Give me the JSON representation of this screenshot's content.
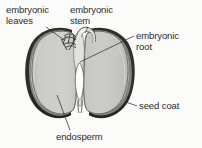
{
  "figure": {
    "labels": {
      "embryonic_leaves": "embryonic\nleaves",
      "embryonic_leaves_line1": "embryonic",
      "embryonic_leaves_line2": "leaves",
      "embryonic_stem_line1": "embryonic",
      "embryonic_stem_line2": "stem",
      "embryonic_root_line1": "embryonic",
      "embryonic_root_line2": "root",
      "seed_coat": "seed  coat",
      "endosperm": "endosperm"
    },
    "colors": {
      "ink": "#2b2b2b",
      "seed_coat_dark": "#2e2c2a",
      "seed_coat_mid": "#4a4744",
      "endosperm_fill": "#c9c9c6",
      "endosperm_fill_light": "#d6d6d3",
      "gap_white": "#fdfdfc",
      "background": "#fbfbfa",
      "leader_line": "#3a3a3a"
    },
    "parts": [
      {
        "name": "embryonic leaves",
        "region": "upper-left interior, feathery plumule"
      },
      {
        "name": "embryonic stem",
        "region": "upper-centre, between cotyledons"
      },
      {
        "name": "embryonic root",
        "region": "centre, radicle pointing down"
      },
      {
        "name": "seed coat",
        "region": "dark outer rim of the seed"
      },
      {
        "name": "endosperm",
        "region": "large stippled grey cotyledon body"
      }
    ]
  }
}
